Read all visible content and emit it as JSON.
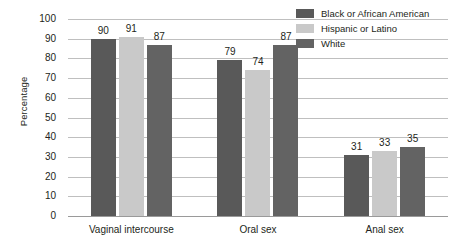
{
  "chart_data": {
    "type": "bar",
    "title": "",
    "xlabel": "",
    "ylabel": "Percentage",
    "ylim": [
      0,
      100
    ],
    "ytick_step": 10,
    "yticks": [
      "100",
      "90",
      "80",
      "70",
      "60",
      "50",
      "40",
      "30",
      "20",
      "10",
      "0"
    ],
    "grid": true,
    "legend_position": "top-right",
    "categories": [
      "Vaginal intercourse",
      "Oral sex",
      "Anal sex"
    ],
    "series": [
      {
        "name": "Black or African American",
        "color": "#595959",
        "values": [
          90,
          79,
          31
        ]
      },
      {
        "name": "Hispanic or Latino",
        "color": "#c9c9c9",
        "values": [
          91,
          74,
          33
        ]
      },
      {
        "name": "White",
        "color": "#636363",
        "values": [
          87,
          87,
          35
        ]
      }
    ]
  },
  "axis": {
    "y_title": "Percentage"
  },
  "legend": {
    "items": [
      {
        "label": "Black or African American",
        "color": "#595959",
        "swatch_name": "legend-swatch-black-or-african-american"
      },
      {
        "label": "Hispanic or Latino",
        "color": "#c9c9c9",
        "swatch_name": "legend-swatch-hispanic-or-latino"
      },
      {
        "label": "White",
        "color": "#636363",
        "swatch_name": "legend-swatch-white"
      }
    ]
  },
  "style": {
    "gridline_color": "#bfbfbf",
    "baseline_color": "#9a9a9a",
    "text_color": "#231f20",
    "background": "#ffffff"
  }
}
